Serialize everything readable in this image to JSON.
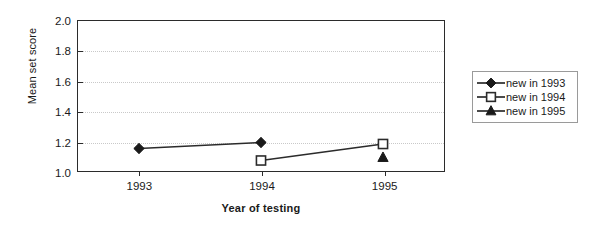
{
  "chart_data": {
    "type": "line",
    "title": "",
    "subtitle": "",
    "xlabel": "Year of testing",
    "ylabel": "Mean set score",
    "categories": [
      "1993",
      "1994",
      "1995"
    ],
    "x": [
      1993,
      1994,
      1995
    ],
    "ylim": [
      1.0,
      2.0
    ],
    "ytick_step": 0.2,
    "yticks": [
      "1.0",
      "1.2",
      "1.4",
      "1.6",
      "1.8",
      "2.0"
    ],
    "ytick_values": [
      1.0,
      1.2,
      1.4,
      1.6,
      1.8,
      2.0
    ],
    "grid": true,
    "grid_axis": "y",
    "grid_style": "dotted",
    "legend_position": "right-outside",
    "series": [
      {
        "name": "new in 1993",
        "marker": "filled-diamond",
        "values": [
          1.15,
          1.19,
          null
        ]
      },
      {
        "name": "new in 1994",
        "marker": "open-square",
        "values": [
          null,
          1.07,
          1.18
        ]
      },
      {
        "name": "new in 1995",
        "marker": "filled-triangle",
        "values": [
          null,
          null,
          1.09
        ]
      }
    ]
  },
  "legend": {
    "items": [
      {
        "label": "new in 1993",
        "marker": "filled-diamond"
      },
      {
        "label": "new in 1994",
        "marker": "open-square"
      },
      {
        "label": "new in 1995",
        "marker": "filled-triangle"
      }
    ]
  },
  "colors": {
    "line": "#2b2b2b",
    "axis": "#2b2b2b",
    "grid": "#c9c9c9",
    "text": "#1a1a1a",
    "marker_fill": "#1a1a1a",
    "marker_open_fill": "#ffffff",
    "background": "#ffffff",
    "legend_border": "#9a9a9a"
  }
}
